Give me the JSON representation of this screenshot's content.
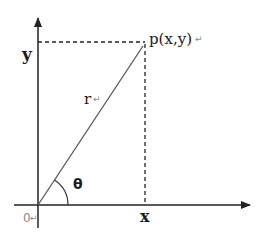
{
  "diagram": {
    "type": "polar-coordinate-diagram",
    "labels": {
      "y_axis": "y",
      "x_axis": "x",
      "point": "p(x,y)",
      "radius": "r",
      "angle": "θ",
      "origin": "0"
    },
    "return_marker": "↵",
    "colors": {
      "line": "#222222",
      "radius": "#555555",
      "dashed": "#222222",
      "background": "#ffffff",
      "marker": "#888888"
    }
  }
}
